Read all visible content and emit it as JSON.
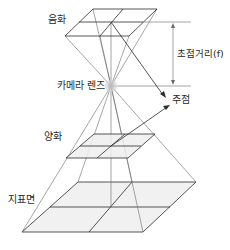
{
  "diagram": {
    "labels": {
      "negative": "음화",
      "focal_length": "초점거리(f)",
      "camera_lens": "카메라 렌즈",
      "principal_point": "주점",
      "positive": "양화",
      "ground_surface": "지표면"
    },
    "colors": {
      "line": "#2b2b2b",
      "ray": "#6a6a6a",
      "plane_fill": "#efefef",
      "lens_glow": "#cfcfcf",
      "text": "#2a2a2a"
    }
  }
}
